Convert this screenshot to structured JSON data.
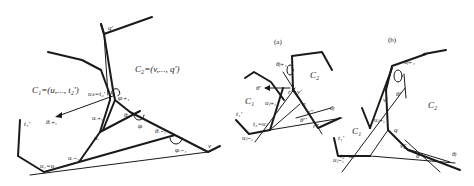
{
  "figure_main": {
    "labels": {
      "q_prime": "q'",
      "c2": "C₂=(v,..., q')",
      "c1": "C₁=(u,..., t₂')",
      "uk_t2": "uₖ=t₂'",
      "phi_i1": "φᵢ₊₁",
      "theta_i1": "θᵢ₊₁",
      "u_i1": "uᵢ₊₁",
      "theta_i": "θᵢ",
      "phi_i": "φᵢ",
      "u_i": "uᵢ",
      "theta_im1": "θᵢ₋₁",
      "phi_im1": "φᵢ₋₁",
      "u_im1": "uᵢ₋₁",
      "t1_prime": "t₁'",
      "u1_u": "u₁=u",
      "v": "v"
    }
  },
  "figure_a": {
    "caption": "(a)",
    "labels": {
      "theta_j1": "θⱼ₊₁",
      "c2": "C₂",
      "theta_prime": "θ'",
      "r_prime": "r'",
      "v_prime": "v'",
      "c1": "C₁",
      "u_j1": "uⱼ₊₁",
      "q": "q",
      "v_dprime": "v''",
      "theta_j": "θⱼ",
      "t1_prime": "t₁'",
      "theta_dprime": "θ''",
      "t2_uj": "t₂=uⱼ",
      "r_dprime": "r''",
      "u_jm1": "uⱼ₋₁"
    }
  },
  "figure_b": {
    "caption": "(b)",
    "labels": {
      "theta_j1": "θⱼ₊₁",
      "theta_prime": "θ'",
      "v_prime": "v'",
      "c2": "C₂",
      "u_j1": "uⱼ₊₁",
      "c1": "C₁",
      "q": "q",
      "t1_prime": "t₁'",
      "v_dprime": "v''",
      "t2_uj": "t₂=uⱼ",
      "u_jm1": "uⱼ₋₁",
      "theta_dprime": "θ''",
      "theta_j": "θⱼ"
    }
  }
}
